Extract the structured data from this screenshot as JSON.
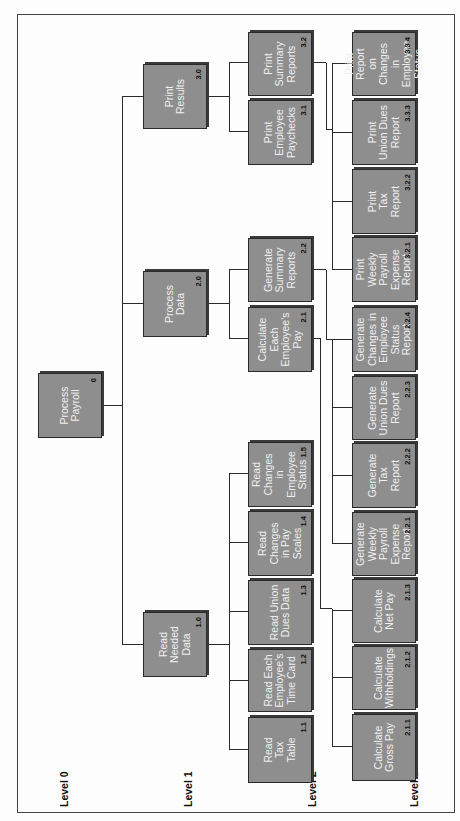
{
  "diagram": {
    "type": "hierarchy-chart",
    "orientation": "rotated-90-ccw",
    "colors": {
      "box_fill": "#8e8e8e",
      "box_border": "#2a2a2a",
      "box_text": "#f0f0f0",
      "number_text": "#111111",
      "line": "#2a2a2a"
    },
    "levels": {
      "l0": "Level 0",
      "l1": "Level 1",
      "l2": "Level 2",
      "l3": "Level 3"
    },
    "root": {
      "label": "Process\nPayroll",
      "number": "0"
    },
    "level1": [
      {
        "label": "Read\nNeeded\nData",
        "number": "1.0"
      },
      {
        "label": "Process\nData",
        "number": "2.0"
      },
      {
        "label": "Print\nResults",
        "number": "3.0"
      }
    ],
    "level2": [
      {
        "label": "Read\nTax\nTable",
        "number": "1.1",
        "parent": "1.0"
      },
      {
        "label": "Read Each\nEmployee's\nTime Card",
        "number": "1.2",
        "parent": "1.0"
      },
      {
        "label": "Read Union\nDues Data",
        "number": "1.3",
        "parent": "1.0"
      },
      {
        "label": "Read\nChanges\nin Pay\nScales",
        "number": "1.4",
        "parent": "1.0"
      },
      {
        "label": "Read\nChanges\nin Employee\nStatus",
        "number": "1.5",
        "parent": "1.0"
      },
      {
        "label": "Calculate\nEach\nEmployee's\nPay",
        "number": "2.1",
        "parent": "2.0"
      },
      {
        "label": "Generate\nSummary\nReports",
        "number": "2.2",
        "parent": "2.0"
      },
      {
        "label": "Print\nEmployee\nPaychecks",
        "number": "3.1",
        "parent": "3.0"
      },
      {
        "label": "Print\nSummary\nReports",
        "number": "3.2",
        "parent": "3.0"
      }
    ],
    "level3": [
      {
        "label": "Calculate\nGross Pay",
        "number": "2.1.1",
        "parent": "2.1"
      },
      {
        "label": "Calculate\nWithholdings",
        "number": "2.1.2",
        "parent": "2.1"
      },
      {
        "label": "Calculate\nNet Pay",
        "number": "2.1.3",
        "parent": "2.1"
      },
      {
        "label": "Generate\nWeekly\nPayroll\nExpense\nReport",
        "number": "2.2.1",
        "parent": "2.2"
      },
      {
        "label": "Generate\nTax\nReport",
        "number": "2.2.2",
        "parent": "2.2"
      },
      {
        "label": "Generate\nUnion Dues\nReport",
        "number": "2.2.3",
        "parent": "2.2"
      },
      {
        "label": "Generate\nChanges in\nEmployee\nStatus\nReport",
        "number": "2.2.4",
        "parent": "2.2"
      },
      {
        "label": "Print Weekly\nPayroll\nExpense\nReport",
        "number": "3.2.1",
        "parent": "3.2"
      },
      {
        "label": "Print\nTax\nReport",
        "number": "3.2.2",
        "parent": "3.2"
      },
      {
        "label": "Print\nUnion Dues\nReport",
        "number": "3.3.3",
        "parent": "3.2"
      },
      {
        "label": "Print Report\non Changes\nin Employee\nStatus",
        "number": "3.3.4",
        "parent": "3.2"
      }
    ]
  }
}
